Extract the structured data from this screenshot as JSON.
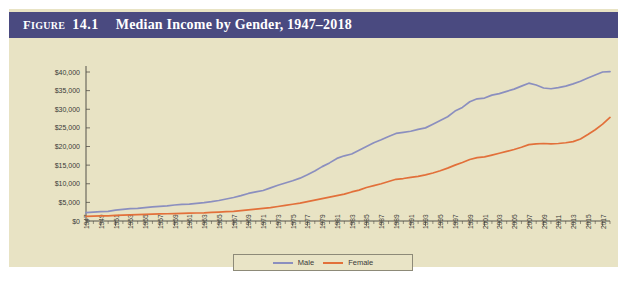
{
  "figure": {
    "label_prefix": "F",
    "label_prefix_rest": "IGURE",
    "number": "14.1",
    "title": "Median Income by Gender, 1947–2018",
    "header_bg": "#4a4a80",
    "panel_bg": "#e8e3c4"
  },
  "legend": {
    "position": "bottom-center",
    "items": [
      {
        "label": "Male",
        "color": "#8b8fbf"
      },
      {
        "label": "Female",
        "color": "#e2703a"
      }
    ]
  },
  "chart_data": {
    "type": "line",
    "title": "Median Income by Gender, 1947–2018",
    "xlabel": "",
    "ylabel": "",
    "grid": false,
    "legend_position": "bottom-center",
    "xlim": [
      1947,
      2018
    ],
    "ylim": [
      0,
      40000
    ],
    "ytick_values": [
      0,
      5000,
      10000,
      15000,
      20000,
      25000,
      30000,
      35000,
      40000
    ],
    "ytick_labels": [
      "$0",
      "$5,000",
      "$10,000",
      "$15,000",
      "$20,000",
      "$25,000",
      "$30,000",
      "$35,000",
      "$40,000"
    ],
    "xtick_labels": [
      "1947",
      "1949",
      "1951",
      "1953",
      "1955",
      "1957",
      "1959",
      "1961",
      "1963",
      "1965",
      "1967",
      "1969",
      "1971",
      "1973",
      "1975",
      "1977",
      "1979",
      "1981",
      "1983",
      "1985",
      "1987",
      "1989",
      "1991",
      "1993",
      "1995",
      "1997",
      "1999",
      "2001",
      "2003",
      "2005",
      "2007",
      "2009",
      "2011",
      "2013",
      "2015",
      "2017"
    ],
    "x": [
      1947,
      1948,
      1949,
      1950,
      1951,
      1952,
      1953,
      1954,
      1955,
      1956,
      1957,
      1958,
      1959,
      1960,
      1961,
      1962,
      1963,
      1964,
      1965,
      1966,
      1967,
      1968,
      1969,
      1970,
      1971,
      1972,
      1973,
      1974,
      1975,
      1976,
      1977,
      1978,
      1979,
      1980,
      1981,
      1982,
      1983,
      1984,
      1985,
      1986,
      1987,
      1988,
      1989,
      1990,
      1991,
      1992,
      1993,
      1994,
      1995,
      1996,
      1997,
      1998,
      1999,
      2000,
      2001,
      2002,
      2003,
      2004,
      2005,
      2006,
      2007,
      2008,
      2009,
      2010,
      2011,
      2012,
      2013,
      2014,
      2015,
      2016,
      2017,
      2018
    ],
    "series": [
      {
        "name": "Male",
        "color": "#8b8fbf",
        "values": [
          2230,
          2400,
          2500,
          2570,
          2900,
          3100,
          3300,
          3400,
          3600,
          3800,
          3950,
          4050,
          4300,
          4450,
          4550,
          4750,
          4950,
          5200,
          5500,
          5900,
          6300,
          6800,
          7400,
          7800,
          8200,
          8900,
          9600,
          10200,
          10800,
          11500,
          12400,
          13400,
          14600,
          15600,
          16800,
          17500,
          18000,
          19000,
          20000,
          21000,
          21800,
          22700,
          23500,
          23800,
          24100,
          24600,
          25000,
          26000,
          27000,
          28000,
          29500,
          30500,
          32000,
          32800,
          33000,
          33800,
          34200,
          34800,
          35400,
          36200,
          37000,
          36500,
          35700,
          35500,
          35800,
          36200,
          36800,
          37500,
          38400,
          39200,
          40000,
          40100
        ]
      },
      {
        "name": "Female",
        "color": "#e2703a",
        "values": [
          1250,
          1300,
          1350,
          1400,
          1500,
          1580,
          1650,
          1700,
          1780,
          1850,
          1900,
          1950,
          2000,
          2050,
          2100,
          2150,
          2200,
          2300,
          2400,
          2500,
          2600,
          2800,
          3000,
          3200,
          3400,
          3600,
          3900,
          4200,
          4500,
          4800,
          5200,
          5600,
          6000,
          6400,
          6800,
          7200,
          7800,
          8300,
          9000,
          9500,
          10000,
          10600,
          11200,
          11400,
          11700,
          12000,
          12400,
          12900,
          13500,
          14200,
          15000,
          15700,
          16500,
          17000,
          17200,
          17700,
          18200,
          18700,
          19200,
          19800,
          20500,
          20700,
          20800,
          20700,
          20800,
          21000,
          21300,
          22000,
          23200,
          24500,
          26000,
          27800
        ]
      }
    ]
  }
}
